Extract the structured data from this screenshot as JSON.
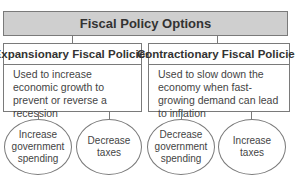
{
  "title": "Fiscal Policy Options",
  "branches": [
    {
      "heading": "Expansionary Fiscal Policies",
      "description": "Used to increase economic growth to prevent or reverse a recession",
      "options": [
        "Increase government spending",
        "Decrease taxes"
      ]
    },
    {
      "heading": "Contractionary Fiscal Policies",
      "description": "Used to slow down the economy when fast-growing demand can lead to inflation",
      "options": [
        "Decrease government spending",
        "Increase taxes"
      ]
    }
  ],
  "colors": {
    "title_bg": "#cfcfcf",
    "border": "#7a7a7a",
    "text": "#3a3a3a"
  }
}
